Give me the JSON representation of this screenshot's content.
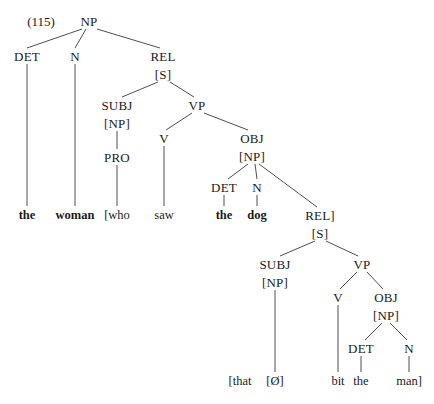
{
  "figure": {
    "example_number": "(115)",
    "type": "syntax-tree"
  },
  "nodes": [
    {
      "id": "np-root",
      "label": "NP",
      "x": 89,
      "y": 21
    },
    {
      "id": "det1",
      "label": "DET",
      "x": 27,
      "y": 56
    },
    {
      "id": "n1",
      "label": "N",
      "x": 75,
      "y": 56
    },
    {
      "id": "rel1",
      "label": "REL",
      "x": 163,
      "y": 56
    },
    {
      "id": "s1",
      "label": "[S]",
      "x": 163,
      "y": 74
    },
    {
      "id": "subj1",
      "label": "SUBJ",
      "x": 117,
      "y": 105
    },
    {
      "id": "np2",
      "label": "[NP]",
      "x": 117,
      "y": 123
    },
    {
      "id": "pro1",
      "label": "PRO",
      "x": 117,
      "y": 157
    },
    {
      "id": "vp1",
      "label": "VP",
      "x": 197,
      "y": 105
    },
    {
      "id": "v1",
      "label": "V",
      "x": 164,
      "y": 138
    },
    {
      "id": "obj1",
      "label": "OBJ",
      "x": 252,
      "y": 138
    },
    {
      "id": "np3",
      "label": "[NP]",
      "x": 252,
      "y": 156
    },
    {
      "id": "det2",
      "label": "DET",
      "x": 224,
      "y": 187
    },
    {
      "id": "n2",
      "label": "N",
      "x": 257,
      "y": 187
    },
    {
      "id": "rel2",
      "label": "REL]",
      "x": 320,
      "y": 215
    },
    {
      "id": "s2",
      "label": "[S]",
      "x": 320,
      "y": 233
    },
    {
      "id": "subj2",
      "label": "SUBJ",
      "x": 275,
      "y": 264
    },
    {
      "id": "np4",
      "label": "[NP]",
      "x": 275,
      "y": 282
    },
    {
      "id": "vp2",
      "label": "VP",
      "x": 362,
      "y": 264
    },
    {
      "id": "v2",
      "label": "V",
      "x": 338,
      "y": 297
    },
    {
      "id": "obj2",
      "label": "OBJ",
      "x": 386,
      "y": 297
    },
    {
      "id": "np5",
      "label": "[NP]",
      "x": 386,
      "y": 315
    },
    {
      "id": "det3",
      "label": "DET",
      "x": 361,
      "y": 348
    },
    {
      "id": "n3",
      "label": "N",
      "x": 409,
      "y": 348
    }
  ],
  "leaves": [
    {
      "id": "leaf-the-1",
      "label": "the",
      "x": 27,
      "y": 215,
      "bold": true
    },
    {
      "id": "leaf-woman",
      "label": "woman",
      "x": 75,
      "y": 215,
      "bold": true
    },
    {
      "id": "leaf-who",
      "label": "[who",
      "x": 117,
      "y": 215,
      "bold": false
    },
    {
      "id": "leaf-saw",
      "label": "saw",
      "x": 164,
      "y": 215,
      "bold": false
    },
    {
      "id": "leaf-the-2",
      "label": "the",
      "x": 224,
      "y": 215,
      "bold": true
    },
    {
      "id": "leaf-dog",
      "label": "dog",
      "x": 257,
      "y": 215,
      "bold": true
    },
    {
      "id": "leaf-that",
      "label": "[that",
      "x": 240,
      "y": 381,
      "bold": false
    },
    {
      "id": "leaf-zero",
      "label": "[Ø]",
      "x": 275,
      "y": 381,
      "bold": false
    },
    {
      "id": "leaf-bit",
      "label": "bit",
      "x": 338,
      "y": 381,
      "bold": false
    },
    {
      "id": "leaf-the-3",
      "label": "the",
      "x": 361,
      "y": 381,
      "bold": false
    },
    {
      "id": "leaf-man",
      "label": "man]",
      "x": 409,
      "y": 381,
      "bold": false
    }
  ],
  "edges": [
    {
      "from": "np-root",
      "to": "det1",
      "x1": 82,
      "y1": 29,
      "x2": 27,
      "y2": 48
    },
    {
      "from": "np-root",
      "to": "n1",
      "x1": 86,
      "y1": 29,
      "x2": 75,
      "y2": 48
    },
    {
      "from": "np-root",
      "to": "rel1",
      "x1": 97,
      "y1": 29,
      "x2": 160,
      "y2": 48
    },
    {
      "from": "det1",
      "to": "leaf-the-1",
      "x1": 27,
      "y1": 64,
      "x2": 27,
      "y2": 206
    },
    {
      "from": "n1",
      "to": "leaf-woman",
      "x1": 75,
      "y1": 64,
      "x2": 75,
      "y2": 206
    },
    {
      "from": "s1",
      "to": "subj1",
      "x1": 158,
      "y1": 82,
      "x2": 122,
      "y2": 97
    },
    {
      "from": "s1",
      "to": "vp1",
      "x1": 170,
      "y1": 82,
      "x2": 194,
      "y2": 97
    },
    {
      "from": "np2",
      "to": "pro1",
      "x1": 117,
      "y1": 131,
      "x2": 117,
      "y2": 149
    },
    {
      "from": "pro1",
      "to": "leaf-who",
      "x1": 117,
      "y1": 165,
      "x2": 117,
      "y2": 206
    },
    {
      "from": "vp1",
      "to": "v1",
      "x1": 192,
      "y1": 113,
      "x2": 166,
      "y2": 130
    },
    {
      "from": "vp1",
      "to": "obj1",
      "x1": 204,
      "y1": 113,
      "x2": 248,
      "y2": 130
    },
    {
      "from": "v1",
      "to": "leaf-saw",
      "x1": 164,
      "y1": 146,
      "x2": 164,
      "y2": 206
    },
    {
      "from": "np3",
      "to": "det2",
      "x1": 248,
      "y1": 164,
      "x2": 228,
      "y2": 179
    },
    {
      "from": "np3",
      "to": "n2",
      "x1": 255,
      "y1": 164,
      "x2": 257,
      "y2": 179
    },
    {
      "from": "np3",
      "to": "rel2",
      "x1": 259,
      "y1": 164,
      "x2": 317,
      "y2": 207
    },
    {
      "from": "det2",
      "to": "leaf-the-2",
      "x1": 224,
      "y1": 195,
      "x2": 224,
      "y2": 206
    },
    {
      "from": "n2",
      "to": "leaf-dog",
      "x1": 257,
      "y1": 195,
      "x2": 257,
      "y2": 206
    },
    {
      "from": "s2",
      "to": "subj2",
      "x1": 315,
      "y1": 241,
      "x2": 280,
      "y2": 256
    },
    {
      "from": "s2",
      "to": "vp2",
      "x1": 326,
      "y1": 241,
      "x2": 358,
      "y2": 256
    },
    {
      "from": "np4",
      "to": "leaf-zero",
      "x1": 275,
      "y1": 290,
      "x2": 275,
      "y2": 372
    },
    {
      "from": "vp2",
      "to": "v2",
      "x1": 357,
      "y1": 272,
      "x2": 340,
      "y2": 289
    },
    {
      "from": "vp2",
      "to": "obj2",
      "x1": 367,
      "y1": 272,
      "x2": 383,
      "y2": 289
    },
    {
      "from": "v2",
      "to": "leaf-bit",
      "x1": 338,
      "y1": 305,
      "x2": 338,
      "y2": 372
    },
    {
      "from": "np5",
      "to": "det3",
      "x1": 382,
      "y1": 323,
      "x2": 365,
      "y2": 340
    },
    {
      "from": "np5",
      "to": "n3",
      "x1": 390,
      "y1": 323,
      "x2": 407,
      "y2": 340
    },
    {
      "from": "det3",
      "to": "leaf-the-3",
      "x1": 361,
      "y1": 356,
      "x2": 361,
      "y2": 372
    },
    {
      "from": "n3",
      "to": "leaf-man",
      "x1": 409,
      "y1": 356,
      "x2": 409,
      "y2": 372
    }
  ],
  "example_label_pos": {
    "x": 41,
    "y": 21
  },
  "colors": {
    "background": "#ffffff",
    "text": "#1a1a1a",
    "line": "#3a3a3a"
  }
}
